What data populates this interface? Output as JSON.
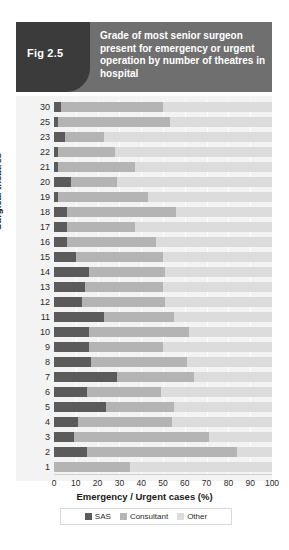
{
  "figure": {
    "tag": "Fig 2.5",
    "title": "Grade of most senior surgeon present for emergency or urgent operation by number of theatres in hospital"
  },
  "legend": {
    "items": [
      {
        "label": "SAS",
        "color": "#5b5b5b"
      },
      {
        "label": "Consultant",
        "color": "#b4b4b4"
      },
      {
        "label": "Other",
        "color": "#dcdcdc"
      }
    ]
  },
  "chart_data": {
    "type": "bar",
    "orientation": "horizontal",
    "stacked": true,
    "stack_total": 100,
    "title": "Grade of most senior surgeon present for emergency or urgent operation by number of theatres in hospital",
    "xlabel": "Emergency / Urgent cases (%)",
    "ylabel": "Surgical theatres",
    "xlim": [
      0,
      100
    ],
    "xticks": [
      0,
      10,
      20,
      30,
      40,
      50,
      60,
      70,
      80,
      90,
      100
    ],
    "xtick_labels": [
      "0",
      "10",
      "20",
      "30",
      "40",
      "50",
      "60",
      "70",
      "80",
      "90",
      "100"
    ],
    "grid": true,
    "legend_position": "bottom",
    "categories": [
      "30",
      "25",
      "23",
      "22",
      "21",
      "20",
      "19",
      "18",
      "17",
      "16",
      "15",
      "14",
      "13",
      "12",
      "11",
      "10",
      "9",
      "8",
      "7",
      "6",
      "5",
      "4",
      "3",
      "2",
      "1"
    ],
    "series": [
      {
        "name": "SAS",
        "color": "#5b5b5b",
        "values": [
          3,
          2,
          5,
          2,
          2,
          8,
          2,
          6,
          6,
          6,
          10,
          16,
          14,
          13,
          23,
          16,
          16,
          17,
          29,
          15,
          24,
          11,
          9,
          15,
          0
        ]
      },
      {
        "name": "Consultant",
        "color": "#b4b4b4",
        "values": [
          47,
          51,
          18,
          26,
          35,
          21,
          41,
          50,
          31,
          41,
          40,
          35,
          36,
          38,
          32,
          46,
          34,
          44,
          35,
          34,
          31,
          43,
          62,
          69,
          35
        ]
      },
      {
        "name": "Other",
        "color": "#dcdcdc",
        "values": [
          50,
          47,
          77,
          72,
          63,
          71,
          57,
          44,
          63,
          53,
          50,
          49,
          50,
          49,
          45,
          38,
          50,
          39,
          36,
          51,
          45,
          46,
          29,
          16,
          65
        ]
      }
    ]
  }
}
